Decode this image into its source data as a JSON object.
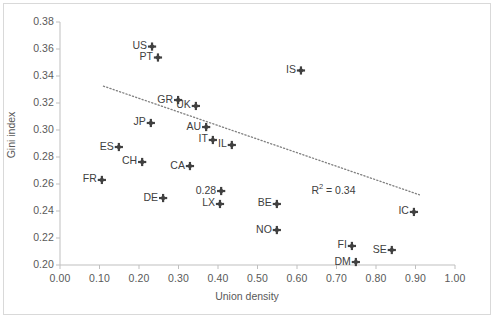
{
  "chart_data": {
    "type": "scatter",
    "title": "",
    "xlabel": "Union density",
    "ylabel": "Gini index",
    "xlim": [
      0.0,
      1.0
    ],
    "ylim": [
      0.2,
      0.38
    ],
    "xticks": [
      "0.00",
      "0.10",
      "0.20",
      "0.30",
      "0.40",
      "0.50",
      "0.60",
      "0.70",
      "0.80",
      "0.90",
      "1.00"
    ],
    "yticks": [
      "0.20",
      "0.22",
      "0.24",
      "0.26",
      "0.28",
      "0.30",
      "0.32",
      "0.34",
      "0.36",
      "0.38"
    ],
    "grid": false,
    "legend": "none",
    "marker_color": "#404040",
    "trendline": {
      "style": "dotted",
      "color": "#7f7f7f",
      "x_start": 0.11,
      "y_start": 0.3325,
      "x_end": 0.91,
      "y_end": 0.252
    },
    "annotations": [
      {
        "name": "r-squared",
        "text": "R² = 0.34",
        "x": 0.725,
        "y": 0.2555
      }
    ],
    "points": [
      {
        "label": "US",
        "x": 0.233,
        "y": 0.3618,
        "label_pos": "left"
      },
      {
        "label": "PT",
        "x": 0.248,
        "y": 0.3537,
        "label_pos": "left"
      },
      {
        "label": "IS",
        "x": 0.61,
        "y": 0.3441,
        "label_pos": "left"
      },
      {
        "label": "GR",
        "x": 0.299,
        "y": 0.3222,
        "label_pos": "left"
      },
      {
        "label": "UK",
        "x": 0.344,
        "y": 0.3178,
        "label_pos": "left"
      },
      {
        "label": "JP",
        "x": 0.23,
        "y": 0.3052,
        "label_pos": "left"
      },
      {
        "label": "AU",
        "x": 0.37,
        "y": 0.3022,
        "label_pos": "left"
      },
      {
        "label": "IT",
        "x": 0.387,
        "y": 0.2926,
        "label_pos": "left"
      },
      {
        "label": "IL",
        "x": 0.435,
        "y": 0.2889,
        "label_pos": "left"
      },
      {
        "label": "ES",
        "x": 0.149,
        "y": 0.2874,
        "label_pos": "left"
      },
      {
        "label": "CH",
        "x": 0.208,
        "y": 0.2763,
        "label_pos": "left"
      },
      {
        "label": "CA",
        "x": 0.329,
        "y": 0.2733,
        "label_pos": "left"
      },
      {
        "label": "FR",
        "x": 0.106,
        "y": 0.263,
        "label_pos": "left"
      },
      {
        "label": "0.28",
        "x": 0.408,
        "y": 0.2548,
        "label_pos": "left"
      },
      {
        "label": "DE",
        "x": 0.261,
        "y": 0.2496,
        "label_pos": "left"
      },
      {
        "label": "LX",
        "x": 0.405,
        "y": 0.2452,
        "label_pos": "left"
      },
      {
        "label": "BE",
        "x": 0.549,
        "y": 0.2452,
        "label_pos": "left"
      },
      {
        "label": "IC",
        "x": 0.896,
        "y": 0.2393,
        "label_pos": "left"
      },
      {
        "label": "NO",
        "x": 0.549,
        "y": 0.2259,
        "label_pos": "left"
      },
      {
        "label": "FI",
        "x": 0.739,
        "y": 0.2141,
        "label_pos": "left"
      },
      {
        "label": "SE",
        "x": 0.84,
        "y": 0.2111,
        "label_pos": "left"
      },
      {
        "label": "DM",
        "x": 0.749,
        "y": 0.2022,
        "label_pos": "left"
      }
    ]
  }
}
